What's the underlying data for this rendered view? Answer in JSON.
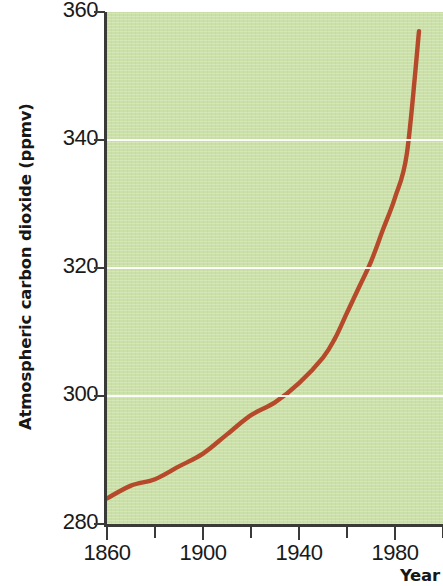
{
  "chart_data": {
    "type": "line",
    "title": "",
    "xlabel": "Year",
    "ylabel": "Atmospheric carbon dioxide (ppmv)",
    "xlim": [
      1860,
      2000
    ],
    "ylim": [
      280,
      360
    ],
    "grid": true,
    "legend": null,
    "background_color": "#cbe0a8",
    "line_color": "#b5492a",
    "line_width": 4,
    "xticks": [
      1860,
      1880,
      1900,
      1920,
      1940,
      1960,
      1980,
      2000
    ],
    "xticklabels": [
      "1860",
      "",
      "1900",
      "",
      "1940",
      "",
      "1980",
      ""
    ],
    "xtick_major": [
      1860,
      1900,
      1940,
      1980
    ],
    "yticks": [
      280,
      300,
      320,
      340,
      360
    ],
    "yticklabels": [
      "280",
      "300",
      "320",
      "340",
      "360"
    ],
    "gridline_values": [
      300,
      320,
      340
    ],
    "x": [
      1860,
      1870,
      1880,
      1890,
      1900,
      1910,
      1920,
      1930,
      1940,
      1950,
      1955,
      1960,
      1965,
      1970,
      1975,
      1980,
      1985,
      1990
    ],
    "values": [
      284,
      286,
      287,
      289,
      291,
      294,
      297,
      299,
      302,
      306,
      309,
      313,
      317,
      321,
      326,
      331,
      338,
      357
    ],
    "series": [
      {
        "name": "Atmospheric carbon dioxide",
        "color": "#b5492a",
        "values": [
          284,
          286,
          287,
          289,
          291,
          294,
          297,
          299,
          302,
          306,
          309,
          313,
          317,
          321,
          326,
          331,
          338,
          357
        ]
      }
    ]
  },
  "axis": {
    "y_title": "Atmospheric carbon dioxide (ppmv)",
    "x_title": "Year",
    "y_labels": [
      "360",
      "340",
      "320",
      "300",
      "280"
    ],
    "x_labels": [
      "1860",
      "1900",
      "1940",
      "1980"
    ]
  }
}
